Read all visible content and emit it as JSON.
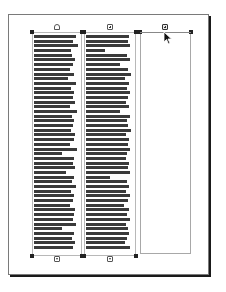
{
  "page": {
    "border_color": "#7a7a7a",
    "shadow_color": "#1a1a1a"
  },
  "frames": [
    {
      "name": "text-frame-1",
      "in_port": "empty",
      "out_port": "threaded",
      "lines": [
        92,
        84,
        96,
        80,
        82,
        90,
        84,
        78,
        88,
        74,
        92,
        80,
        86,
        84,
        90,
        78,
        94,
        82,
        88,
        84,
        80,
        90,
        86,
        78,
        94,
        60,
        88,
        84,
        90,
        70,
        86,
        82,
        92,
        80,
        88,
        84,
        78,
        90,
        86,
        84,
        92,
        60,
        88,
        82,
        90,
        84,
        78,
        86,
        92,
        80,
        88,
        56,
        90,
        84,
        88,
        82,
        92,
        86,
        80,
        88,
        84,
        90,
        86,
        82,
        92,
        88,
        84,
        80,
        90,
        86,
        84,
        88,
        82,
        90,
        86,
        84,
        92,
        88,
        80,
        86,
        90,
        84,
        88,
        82,
        86,
        90,
        84,
        88,
        80,
        86,
        90,
        84,
        82,
        88,
        86,
        90,
        84,
        88,
        82,
        86
      ]
    },
    {
      "name": "text-frame-2",
      "in_port": "threaded",
      "out_port": "threaded",
      "lines": [
        90,
        88,
        92,
        40,
        86,
        92,
        70,
        88,
        94,
        82,
        90,
        86,
        92,
        88,
        84,
        90,
        70,
        92,
        86,
        88,
        94,
        84,
        90,
        88,
        92,
        86,
        84,
        90,
        88,
        92,
        50,
        86,
        90,
        84,
        92,
        88,
        80,
        90,
        86,
        92,
        84,
        88,
        90,
        86,
        82,
        92,
        88,
        84,
        90,
        86,
        92,
        88,
        84,
        90,
        86,
        88,
        92,
        84,
        90,
        86,
        88,
        92,
        84,
        86,
        90,
        88,
        84,
        92,
        86,
        90,
        88,
        84,
        92,
        86,
        88,
        90,
        84,
        92,
        86,
        88,
        90,
        84,
        88,
        92,
        86,
        90,
        84,
        88,
        92,
        86,
        90,
        88,
        84,
        92,
        86,
        88,
        90,
        84,
        88,
        86
      ]
    },
    {
      "name": "text-frame-3",
      "in_port": "threaded-active",
      "out_port": "none",
      "lines": []
    }
  ],
  "cursor": {
    "icon": "arrow-pointer-icon"
  }
}
